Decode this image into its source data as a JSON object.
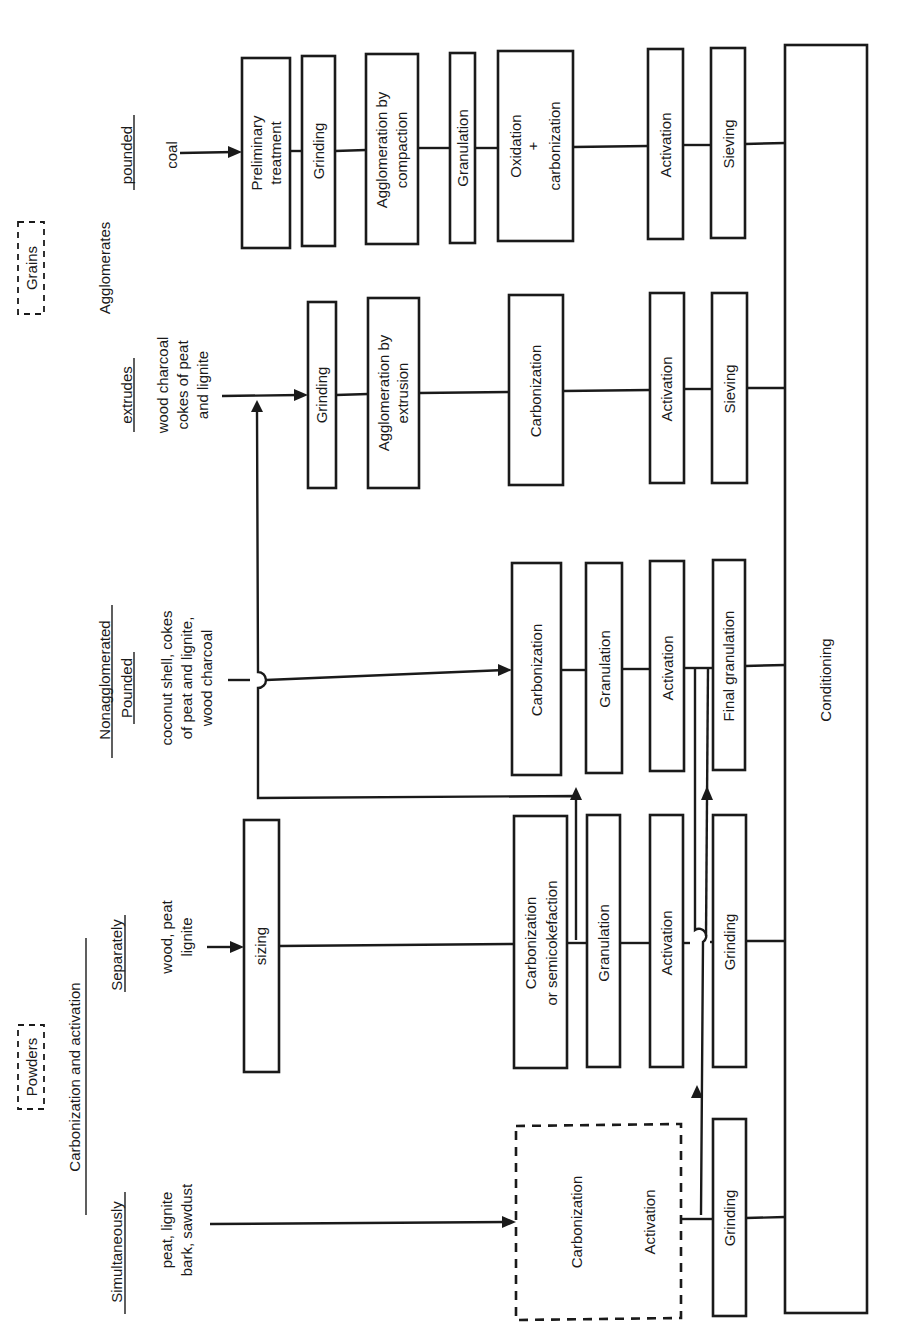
{
  "categories": {
    "grains": "Grains",
    "powders": "Powders",
    "agglomerates": "Agglomerates",
    "nonagglomerated": "Nonagglomerated",
    "carbonization_and_activation": "Carbonization and activation"
  },
  "columns": {
    "pounded_coal": {
      "heading": "pounded",
      "feed": [
        "coal"
      ],
      "steps": [
        "Preliminary treatment",
        "Grinding",
        "Agglomeration by compaction",
        "Granulation",
        "Oxidation + carbonization",
        "Activation",
        "Sieving"
      ]
    },
    "extrudes": {
      "heading": "extrudes",
      "feed": [
        "wood charcoal",
        "cokes of peat",
        "and lignite"
      ],
      "steps": [
        "Grinding",
        "Agglomeration by extrusion",
        "Carbonization",
        "Activation",
        "Sieving"
      ]
    },
    "pounded_nonagglomerated": {
      "heading": "Pounded",
      "feed": [
        "coconut shell, cokes",
        "of peat and lignite,",
        "wood charcoal"
      ],
      "steps": [
        "Carbonization",
        "Granulation",
        "Activation",
        "Final granulation"
      ]
    },
    "separately": {
      "heading": "Separately",
      "feed": [
        "wood, peat",
        "lignite"
      ],
      "steps": [
        "sizing",
        "Carbonization or semicokefaction",
        "Granulation",
        "Activation",
        "Grinding"
      ]
    },
    "simultaneously": {
      "heading": "Simultaneously",
      "feed": [
        "peat, lignite",
        "bark, sawdust"
      ],
      "steps": [
        "Carbonization",
        "Activation",
        "Grinding"
      ]
    }
  },
  "final_step": "Conditioning",
  "labels": {
    "preliminary_1": "Preliminary",
    "preliminary_2": "treatment",
    "aggl_comp_1": "Agglomeration by",
    "aggl_comp_2": "compaction",
    "oxid_1": "Oxidation",
    "oxid_plus": "+",
    "oxid_2": "carbonization",
    "aggl_ext_1": "Agglomeration by",
    "aggl_ext_2": "extrusion",
    "carb_semi_1": "Carbonization",
    "carb_semi_2": "or semicokefaction",
    "grinding": "Grinding",
    "granulation": "Granulation",
    "carbonization": "Carbonization",
    "activation": "Activation",
    "sieving": "Sieving",
    "final_granulation": "Final  granulation",
    "sizing": "sizing"
  }
}
